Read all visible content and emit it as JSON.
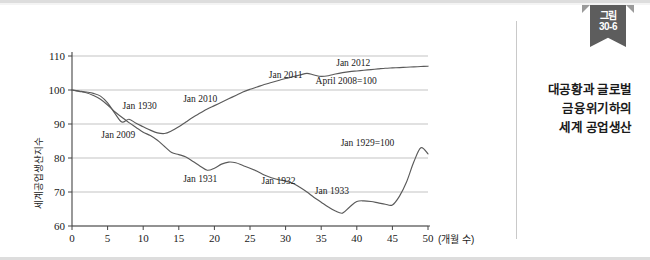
{
  "figure": {
    "ribbon_line1": "그림",
    "ribbon_line2": "30-6",
    "title_line1": "대공황과 글로벌",
    "title_line2": "금융위기하의",
    "title_line3": "세계 공업생산"
  },
  "chart_data": {
    "type": "line",
    "title": "",
    "xlabel": "(개월 수)",
    "ylabel": "세계공업생산지수",
    "xlim": [
      0,
      50
    ],
    "ylim": [
      60,
      110
    ],
    "xticks": [
      "0",
      "5",
      "10",
      "15",
      "20",
      "25",
      "30",
      "35",
      "40",
      "45",
      "50"
    ],
    "yticks": [
      "110",
      "100",
      "90",
      "80",
      "70",
      "60"
    ],
    "grid": "horizontal",
    "legend_position": "inline-annotations",
    "line_color": "#5a5a5a",
    "series": [
      {
        "name": "Jan 1929=100",
        "base_label": "Jan 1929=100",
        "x": [
          0,
          1,
          2,
          3,
          4,
          5,
          6,
          7,
          8,
          9,
          10,
          11,
          12,
          13,
          14,
          15,
          16,
          17,
          18,
          19,
          20,
          21,
          22,
          23,
          24,
          25,
          26,
          27,
          28,
          29,
          30,
          31,
          32,
          33,
          34,
          35,
          36,
          37,
          38,
          39,
          40,
          41,
          42,
          43,
          44,
          45,
          46,
          47,
          48,
          49,
          50
        ],
        "values": [
          100,
          99.6,
          99.2,
          98.4,
          97.3,
          95.6,
          93.6,
          92.0,
          90.4,
          89.0,
          87.6,
          86.6,
          85.2,
          83.4,
          81.6,
          81.0,
          80.3,
          79.0,
          77.6,
          76.4,
          77.0,
          78.2,
          78.8,
          78.6,
          77.8,
          77.0,
          76.1,
          75.0,
          74.2,
          73.6,
          73.2,
          72.6,
          71.4,
          70.0,
          68.4,
          67.0,
          65.6,
          64.4,
          63.8,
          65.6,
          67.2,
          67.4,
          67.2,
          66.8,
          66.4,
          66.2,
          68.8,
          73.0,
          78.8,
          83.0,
          81.2
        ]
      },
      {
        "name": "April 2008=100",
        "base_label": "April 2008=100",
        "x": [
          0,
          1,
          2,
          3,
          4,
          5,
          6,
          7,
          8,
          9,
          10,
          11,
          12,
          13,
          14,
          15,
          16,
          17,
          18,
          19,
          20,
          21,
          22,
          23,
          24,
          25,
          26,
          27,
          28,
          29,
          30,
          31,
          32,
          33,
          34,
          35,
          36,
          37,
          38,
          39,
          40,
          41,
          42,
          43,
          44,
          45,
          46,
          47,
          48,
          49,
          50
        ],
        "values": [
          100,
          99.7,
          99.4,
          99.0,
          98.2,
          96.2,
          93.2,
          90.6,
          91.4,
          90.2,
          89.2,
          88.2,
          87.4,
          87.2,
          88.0,
          89.2,
          90.6,
          92.0,
          93.2,
          94.4,
          95.4,
          96.4,
          97.4,
          98.4,
          99.4,
          100.2,
          100.9,
          101.6,
          102.2,
          102.8,
          103.4,
          103.9,
          104.4,
          104.9,
          104.4,
          104.0,
          104.2,
          104.7,
          105.1,
          105.4,
          105.6,
          105.8,
          106.0,
          106.2,
          106.4,
          106.5,
          106.6,
          106.7,
          106.8,
          106.9,
          107.0
        ]
      }
    ],
    "annotations": [
      {
        "text": "Jan 1930",
        "x": 9.5,
        "y": 94.5
      },
      {
        "text": "Jan 2009",
        "x": 6.5,
        "y": 86.0
      },
      {
        "text": "Jan 2010",
        "x": 18.0,
        "y": 96.5
      },
      {
        "text": "Jan 2011",
        "x": 30.0,
        "y": 103.5
      },
      {
        "text": "Jan 2012",
        "x": 39.5,
        "y": 107.0
      },
      {
        "text": "April 2008=100",
        "x": 38.5,
        "y": 101.8
      },
      {
        "text": "Jan 1931",
        "x": 18.0,
        "y": 73.0
      },
      {
        "text": "Jan 1932",
        "x": 29.0,
        "y": 72.5
      },
      {
        "text": "Jan 1933",
        "x": 36.5,
        "y": 69.5
      },
      {
        "text": "Jan 1929=100",
        "x": 41.5,
        "y": 83.5
      }
    ]
  }
}
